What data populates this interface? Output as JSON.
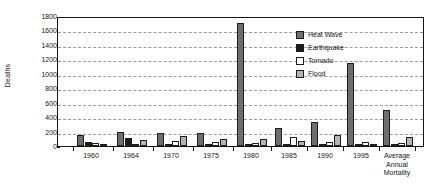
{
  "chart_data": {
    "type": "bar",
    "title": "",
    "subtitle": "",
    "xlabel": "",
    "ylabel": "Deaths",
    "ylim": [
      0,
      1800
    ],
    "ytick_step": 200,
    "yticks": [
      0,
      200,
      400,
      600,
      800,
      1000,
      1200,
      1400,
      1600,
      1800
    ],
    "ytick_labels": [
      "0",
      "200",
      "400",
      "600",
      "800",
      "1000",
      "1200",
      "1400",
      "1600",
      "1800"
    ],
    "grid": true,
    "grid_style": "dashed-horizontal",
    "legend_position": "inside-top-right",
    "categories": [
      "1960",
      "1964",
      "1970",
      "1975",
      "1980",
      "1985",
      "1990",
      "1995",
      "Average\nAnnual\nMortality"
    ],
    "tick_labels": [
      "1960",
      "1964",
      "1970",
      "1975",
      "1980",
      "1985",
      "1990",
      "1995",
      "Average Annual Mortality"
    ],
    "series": [
      {
        "name": "Heat Wave",
        "color": "#6e6e6e",
        "values": [
          150,
          190,
          175,
          180,
          1700,
          255,
          330,
          1150,
          500
        ]
      },
      {
        "name": "Earthquake",
        "color": "#1c1c1c",
        "values": [
          55,
          115,
          5,
          5,
          5,
          20,
          20,
          5,
          20
        ]
      },
      {
        "name": "Tornado",
        "color": "#ffffff",
        "values": [
          45,
          30,
          70,
          55,
          35,
          120,
          55,
          60,
          35
        ]
      },
      {
        "name": "Flood",
        "color": "#b4b4b4",
        "values": [
          30,
          90,
          135,
          100,
          95,
          75,
          150,
          15,
          130
        ]
      }
    ]
  },
  "legend": {
    "items": [
      {
        "label": "Heat Wave",
        "swatch": "heatwave"
      },
      {
        "label": "Earthquake",
        "swatch": "earthquake"
      },
      {
        "label": "Tornado",
        "swatch": "tornado"
      },
      {
        "label": "Flood",
        "swatch": "flood"
      }
    ]
  }
}
